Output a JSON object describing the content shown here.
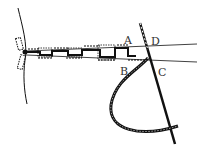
{
  "diagram": {
    "type": "sewing-stitch-illustration",
    "labels": {
      "A": "A",
      "B": "B",
      "C": "C",
      "D": "D"
    },
    "colors": {
      "ink": "#111111",
      "background": "#ffffff"
    }
  }
}
